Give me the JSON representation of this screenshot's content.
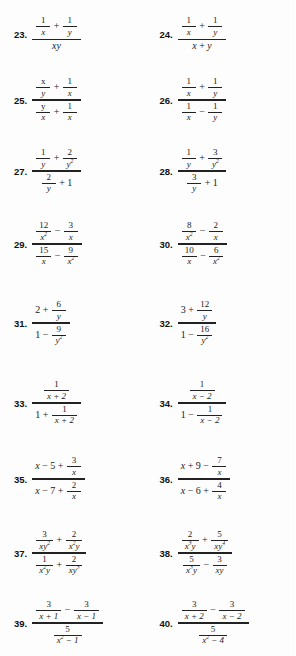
{
  "page": {
    "type": "math-exercise-page",
    "columns": 2,
    "first_number": 23,
    "last_number": 40,
    "background_color": "#fdfdfd",
    "text_color": "#1a1a1a"
  },
  "problems": [
    {
      "number": "23.",
      "latex": "\\dfrac{\\frac{1}{x}+\\frac{1}{y}}{xy}",
      "numerator": "1/x + 1/y",
      "denominator": "xy",
      "num_parts": [
        {
          "kind": "frac",
          "top": "1",
          "bot": "x"
        },
        {
          "kind": "op",
          "text": "+"
        },
        {
          "kind": "frac",
          "top": "1",
          "bot": "y"
        }
      ],
      "den_parts": [
        {
          "kind": "term",
          "text": "xy"
        }
      ]
    },
    {
      "number": "24.",
      "latex": "\\dfrac{\\frac{1}{x}+\\frac{1}{y}}{x+y}",
      "numerator": "1/x + 1/y",
      "denominator": "x + y",
      "num_parts": [
        {
          "kind": "frac",
          "top": "1",
          "bot": "x"
        },
        {
          "kind": "op",
          "text": "+"
        },
        {
          "kind": "frac",
          "top": "1",
          "bot": "y"
        }
      ],
      "den_parts": [
        {
          "kind": "term",
          "text": "x"
        },
        {
          "kind": "op",
          "text": "+"
        },
        {
          "kind": "term",
          "text": "y"
        }
      ]
    },
    {
      "number": "25.",
      "latex": "\\dfrac{\\frac{x}{y}+\\frac{1}{x}}{\\frac{y}{x}+\\frac{1}{x}}",
      "numerator": "x/y + 1/x",
      "denominator": "y/x + 1/x",
      "num_parts": [
        {
          "kind": "frac",
          "top": "x",
          "bot": "y"
        },
        {
          "kind": "op",
          "text": "+"
        },
        {
          "kind": "frac",
          "top": "1",
          "bot": "x"
        }
      ],
      "den_parts": [
        {
          "kind": "frac",
          "top": "y",
          "bot": "x"
        },
        {
          "kind": "op",
          "text": "+"
        },
        {
          "kind": "frac",
          "top": "1",
          "bot": "x"
        }
      ]
    },
    {
      "number": "26.",
      "latex": "\\dfrac{\\frac{1}{x}+\\frac{1}{y}}{\\frac{1}{x}-\\frac{1}{y}}",
      "numerator": "1/x + 1/y",
      "denominator": "1/x - 1/y",
      "num_parts": [
        {
          "kind": "frac",
          "top": "1",
          "bot": "x"
        },
        {
          "kind": "op",
          "text": "+"
        },
        {
          "kind": "frac",
          "top": "1",
          "bot": "y"
        }
      ],
      "den_parts": [
        {
          "kind": "frac",
          "top": "1",
          "bot": "x"
        },
        {
          "kind": "op",
          "text": "−"
        },
        {
          "kind": "frac",
          "top": "1",
          "bot": "y"
        }
      ]
    },
    {
      "number": "27.",
      "latex": "\\dfrac{\\frac{1}{y}+\\frac{2}{y^2}}{\\frac{2}{y}+1}",
      "numerator": "1/y + 2/y^2",
      "denominator": "2/y + 1",
      "num_parts": [
        {
          "kind": "frac",
          "top": "1",
          "bot": "y"
        },
        {
          "kind": "op",
          "text": "+"
        },
        {
          "kind": "frac",
          "top": "2",
          "bot": "y",
          "bot_sup": "2"
        }
      ],
      "den_parts": [
        {
          "kind": "frac",
          "top": "2",
          "bot": "y"
        },
        {
          "kind": "op",
          "text": "+"
        },
        {
          "kind": "term",
          "text": "1",
          "upright": true
        }
      ]
    },
    {
      "number": "28.",
      "latex": "\\dfrac{\\frac{1}{y}+\\frac{3}{y^2}}{\\frac{3}{y}+1}",
      "numerator": "1/y + 3/y^2",
      "denominator": "3/y + 1",
      "num_parts": [
        {
          "kind": "frac",
          "top": "1",
          "bot": "y"
        },
        {
          "kind": "op",
          "text": "+"
        },
        {
          "kind": "frac",
          "top": "3",
          "bot": "y",
          "bot_sup": "2"
        }
      ],
      "den_parts": [
        {
          "kind": "frac",
          "top": "3",
          "bot": "y"
        },
        {
          "kind": "op",
          "text": "+"
        },
        {
          "kind": "term",
          "text": "1",
          "upright": true
        }
      ]
    },
    {
      "number": "29.",
      "latex": "\\dfrac{\\frac{12}{x^2}-\\frac{3}{x}}{\\frac{15}{x}-\\frac{9}{x^2}}",
      "numerator": "12/x^2 - 3/x",
      "denominator": "15/x - 9/x^2",
      "num_parts": [
        {
          "kind": "frac",
          "top": "12",
          "bot": "x",
          "bot_sup": "2"
        },
        {
          "kind": "op",
          "text": "−"
        },
        {
          "kind": "frac",
          "top": "3",
          "bot": "x"
        }
      ],
      "den_parts": [
        {
          "kind": "frac",
          "top": "15",
          "bot": "x"
        },
        {
          "kind": "op",
          "text": "−"
        },
        {
          "kind": "frac",
          "top": "9",
          "bot": "x",
          "bot_sup": "2"
        }
      ]
    },
    {
      "number": "30.",
      "latex": "\\dfrac{\\frac{8}{x^2}-\\frac{2}{x}}{\\frac{10}{x}-\\frac{6}{x^2}}",
      "numerator": "8/x^2 - 2/x",
      "denominator": "10/x - 6/x^2",
      "num_parts": [
        {
          "kind": "frac",
          "top": "8",
          "bot": "x",
          "bot_sup": "2"
        },
        {
          "kind": "op",
          "text": "−"
        },
        {
          "kind": "frac",
          "top": "2",
          "bot": "x"
        }
      ],
      "den_parts": [
        {
          "kind": "frac",
          "top": "10",
          "bot": "x"
        },
        {
          "kind": "op",
          "text": "−"
        },
        {
          "kind": "frac",
          "top": "6",
          "bot": "x",
          "bot_sup": "2"
        }
      ]
    },
    {
      "number": "31.",
      "latex": "\\dfrac{2+\\frac{6}{y}}{1-\\frac{9}{y^2}}",
      "numerator": "2 + 6/y",
      "denominator": "1 - 9/y^2",
      "num_parts": [
        {
          "kind": "term",
          "text": "2",
          "upright": true
        },
        {
          "kind": "op",
          "text": "+"
        },
        {
          "kind": "frac",
          "top": "6",
          "bot": "y"
        }
      ],
      "den_parts": [
        {
          "kind": "term",
          "text": "1",
          "upright": true
        },
        {
          "kind": "op",
          "text": "−"
        },
        {
          "kind": "frac",
          "top": "9",
          "bot": "y",
          "bot_sup": "2"
        }
      ]
    },
    {
      "number": "32.",
      "latex": "\\dfrac{3+\\frac{12}{y}}{1-\\frac{16}{y^2}}",
      "numerator": "3 + 12/y",
      "denominator": "1 - 16/y^2",
      "num_parts": [
        {
          "kind": "term",
          "text": "3",
          "upright": true
        },
        {
          "kind": "op",
          "text": "+"
        },
        {
          "kind": "frac",
          "top": "12",
          "bot": "y"
        }
      ],
      "den_parts": [
        {
          "kind": "term",
          "text": "1",
          "upright": true
        },
        {
          "kind": "op",
          "text": "−"
        },
        {
          "kind": "frac",
          "top": "16",
          "bot": "y",
          "bot_sup": "2"
        }
      ]
    },
    {
      "number": "33.",
      "latex": "\\dfrac{\\frac{1}{x+2}}{1+\\frac{1}{x+2}}",
      "numerator": "1/(x + 2)",
      "denominator": "1 + 1/(x + 2)",
      "num_parts": [
        {
          "kind": "frac",
          "top": "1",
          "bot": "x + 2"
        }
      ],
      "den_parts": [
        {
          "kind": "term",
          "text": "1",
          "upright": true
        },
        {
          "kind": "op",
          "text": "+"
        },
        {
          "kind": "frac",
          "top": "1",
          "bot": "x + 2"
        }
      ]
    },
    {
      "number": "34.",
      "latex": "\\dfrac{\\frac{1}{x-2}}{1-\\frac{1}{x-2}}",
      "numerator": "1/(x - 2)",
      "denominator": "1 - 1/(x - 2)",
      "num_parts": [
        {
          "kind": "frac",
          "top": "1",
          "bot": "x − 2"
        }
      ],
      "den_parts": [
        {
          "kind": "term",
          "text": "1",
          "upright": true
        },
        {
          "kind": "op",
          "text": "−"
        },
        {
          "kind": "frac",
          "top": "1",
          "bot": "x − 2"
        }
      ]
    },
    {
      "number": "35.",
      "latex": "\\dfrac{x-5+\\frac{3}{x}}{x-7+\\frac{2}{x}}",
      "numerator": "x - 5 + 3/x",
      "denominator": "x - 7 + 2/x",
      "num_parts": [
        {
          "kind": "term",
          "text": "x"
        },
        {
          "kind": "op",
          "text": "−"
        },
        {
          "kind": "term",
          "text": "5",
          "upright": true
        },
        {
          "kind": "op",
          "text": "+"
        },
        {
          "kind": "frac",
          "top": "3",
          "bot": "x"
        }
      ],
      "den_parts": [
        {
          "kind": "term",
          "text": "x"
        },
        {
          "kind": "op",
          "text": "−"
        },
        {
          "kind": "term",
          "text": "7",
          "upright": true
        },
        {
          "kind": "op",
          "text": "+"
        },
        {
          "kind": "frac",
          "top": "2",
          "bot": "x"
        }
      ]
    },
    {
      "number": "36.",
      "latex": "\\dfrac{x+9-\\frac{7}{x}}{x-6+\\frac{4}{x}}",
      "numerator": "x + 9 - 7/x",
      "denominator": "x - 6 + 4/x",
      "num_parts": [
        {
          "kind": "term",
          "text": "x"
        },
        {
          "kind": "op",
          "text": "+"
        },
        {
          "kind": "term",
          "text": "9",
          "upright": true
        },
        {
          "kind": "op",
          "text": "−"
        },
        {
          "kind": "frac",
          "top": "7",
          "bot": "x"
        }
      ],
      "den_parts": [
        {
          "kind": "term",
          "text": "x"
        },
        {
          "kind": "op",
          "text": "−"
        },
        {
          "kind": "term",
          "text": "6",
          "upright": true
        },
        {
          "kind": "op",
          "text": "+"
        },
        {
          "kind": "frac",
          "top": "4",
          "bot": "x"
        }
      ]
    },
    {
      "number": "37.",
      "latex": "\\dfrac{\\frac{3}{xy^2}+\\frac{2}{x^2y}}{\\frac{1}{x^2y}+\\frac{2}{xy^3}}",
      "numerator": "3/(xy^2) + 2/(x^2 y)",
      "denominator": "1/(x^2 y) + 2/(xy^3)",
      "num_parts": [
        {
          "kind": "frac",
          "top": "3",
          "bot": "xy",
          "bot_sup": "2"
        },
        {
          "kind": "op",
          "text": "+"
        },
        {
          "kind": "frac",
          "top": "2",
          "bot_pre": "x",
          "bot_sup": "2",
          "bot_post": "y"
        }
      ],
      "den_parts": [
        {
          "kind": "frac",
          "top": "1",
          "bot_pre": "x",
          "bot_sup": "2",
          "bot_post": "y"
        },
        {
          "kind": "op",
          "text": "+"
        },
        {
          "kind": "frac",
          "top": "2",
          "bot": "xy",
          "bot_sup": "3"
        }
      ]
    },
    {
      "number": "38.",
      "latex": "\\dfrac{\\frac{2}{x^3y}+\\frac{5}{xy^4}}{\\frac{5}{x^3y}-\\frac{3}{xy}}",
      "numerator": "2/(x^3 y) + 5/(xy^4)",
      "denominator": "5/(x^3 y) - 3/(xy)",
      "num_parts": [
        {
          "kind": "frac",
          "top": "2",
          "bot_pre": "x",
          "bot_sup": "3",
          "bot_post": "y"
        },
        {
          "kind": "op",
          "text": "+"
        },
        {
          "kind": "frac",
          "top": "5",
          "bot": "xy",
          "bot_sup": "4"
        }
      ],
      "den_parts": [
        {
          "kind": "frac",
          "top": "5",
          "bot_pre": "x",
          "bot_sup": "3",
          "bot_post": "y"
        },
        {
          "kind": "op",
          "text": "−"
        },
        {
          "kind": "frac",
          "top": "3",
          "bot": "xy"
        }
      ]
    },
    {
      "number": "39.",
      "latex": "\\dfrac{\\frac{3}{x+1}-\\frac{3}{x-1}}{\\frac{5}{x^2-1}}",
      "numerator": "3/(x + 1) - 3/(x - 1)",
      "denominator": "5/(x^2 - 1)",
      "num_parts": [
        {
          "kind": "frac",
          "top": "3",
          "bot": "x + 1"
        },
        {
          "kind": "op",
          "text": "−"
        },
        {
          "kind": "frac",
          "top": "3",
          "bot": "x − 1"
        }
      ],
      "den_parts": [
        {
          "kind": "frac",
          "top": "5",
          "bot_pre": "x",
          "bot_sup": "2",
          "bot_post": " − 1"
        }
      ]
    },
    {
      "number": "40.",
      "latex": "\\dfrac{\\frac{3}{x+2}-\\frac{3}{x-2}}{\\frac{5}{x^2-4}}",
      "numerator": "3/(x + 2) - 3/(x - 2)",
      "denominator": "5/(x^2 - 4)",
      "num_parts": [
        {
          "kind": "frac",
          "top": "3",
          "bot": "x + 2"
        },
        {
          "kind": "op",
          "text": "−"
        },
        {
          "kind": "frac",
          "top": "3",
          "bot": "x − 2"
        }
      ],
      "den_parts": [
        {
          "kind": "frac",
          "top": "5",
          "bot_pre": "x",
          "bot_sup": "2",
          "bot_post": " − 4"
        }
      ]
    }
  ]
}
